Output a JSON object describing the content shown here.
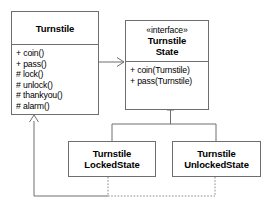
{
  "diagram": {
    "kind": "uml-class-diagram",
    "colors": {
      "background": "#ffffff",
      "line": "#6e6e6e",
      "text": "#000000"
    },
    "classes": {
      "turnstile": {
        "name": "Turnstile",
        "methods": [
          "+ coin()",
          "+ pass()",
          "# lock()",
          "# unlock()",
          "# thankyou()",
          "# alarm()"
        ]
      },
      "turnstile_state": {
        "stereotype": "«interface»",
        "name_line1": "Turnstile",
        "name_line2": "State",
        "methods": [
          "+ coin(Turnstile)",
          "+ pass(Turnstile)"
        ]
      },
      "locked_state": {
        "name_line1": "Turnstile",
        "name_line2": "LockedState"
      },
      "unlocked_state": {
        "name_line1": "Turnstile",
        "name_line2": "UnlockedState"
      }
    },
    "relationships": [
      {
        "id": "association",
        "from": "Turnstile",
        "to": "TurnstileState",
        "style": "solid",
        "arrow": "open-arrow"
      },
      {
        "id": "generalization-locked",
        "from": "TurnstileLockedState",
        "to": "TurnstileState",
        "style": "solid",
        "arrow": "hollow-triangle"
      },
      {
        "id": "generalization-unlocked",
        "from": "TurnstileUnlockedState",
        "to": "TurnstileState",
        "style": "solid",
        "arrow": "hollow-triangle"
      },
      {
        "id": "dependency-to-turnstile",
        "from": "StateSubclasses",
        "to": "Turnstile",
        "style": "dotted",
        "arrow": "open-arrow"
      }
    ]
  }
}
